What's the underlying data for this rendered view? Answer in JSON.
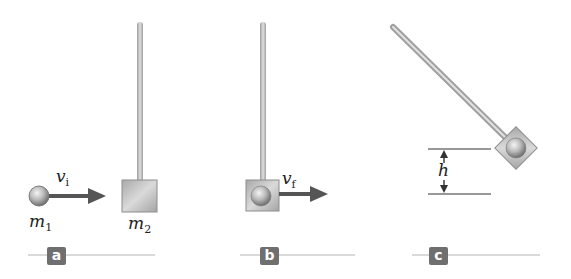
{
  "figure": {
    "panels": [
      {
        "id": "a",
        "label": "a",
        "mass1": "m",
        "mass1_sub": "1",
        "mass2": "m",
        "mass2_sub": "2",
        "velocity": "v",
        "velocity_sub": "i"
      },
      {
        "id": "b",
        "label": "b",
        "velocity": "v",
        "velocity_sub": "f"
      },
      {
        "id": "c",
        "label": "c",
        "height": "h"
      }
    ],
    "colors": {
      "arrow": "#555555",
      "rod": "#c4c4c4",
      "block": "#bdbdbd",
      "ball": "#a8a8a8",
      "tag": "#6f6f6f",
      "rule": "#cccccc"
    }
  }
}
